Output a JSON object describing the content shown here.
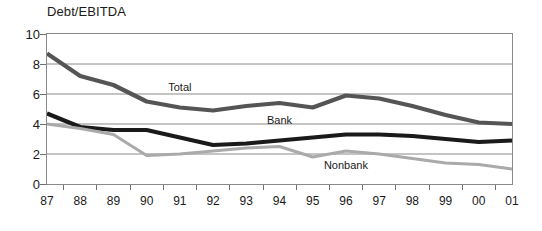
{
  "chart_data": {
    "type": "line",
    "title": "Debt/EBITDA",
    "xlabel": "",
    "ylabel": "",
    "ylim": [
      0,
      10
    ],
    "yticks": [
      0,
      2,
      4,
      6,
      8,
      10
    ],
    "grid": true,
    "legend_position": "inline-annotations",
    "categories": [
      "87",
      "88",
      "89",
      "90",
      "91",
      "92",
      "93",
      "94",
      "95",
      "96",
      "97",
      "98",
      "99",
      "00",
      "01"
    ],
    "series": [
      {
        "name": "Total",
        "color": "#555555",
        "width": 4.2,
        "label_x_category": "91",
        "label_value": 6.5,
        "values": [
          8.7,
          7.2,
          6.6,
          5.5,
          5.1,
          4.9,
          5.2,
          5.4,
          5.1,
          5.9,
          5.7,
          5.2,
          4.6,
          4.1,
          4.0
        ]
      },
      {
        "name": "Bank",
        "color": "#1a1a1a",
        "width": 4.2,
        "label_x_category": "94",
        "label_value": 4.3,
        "values": [
          4.7,
          3.8,
          3.6,
          3.6,
          3.1,
          2.6,
          2.7,
          2.9,
          3.1,
          3.3,
          3.3,
          3.2,
          3.0,
          2.8,
          2.9
        ]
      },
      {
        "name": "Nonbank",
        "color": "#aaaaaa",
        "width": 3.0,
        "label_x_category": "96",
        "label_value": 1.3,
        "values": [
          4.0,
          3.7,
          3.3,
          1.9,
          2.0,
          2.2,
          2.4,
          2.5,
          1.8,
          2.2,
          2.0,
          1.7,
          1.4,
          1.3,
          1.0
        ]
      }
    ]
  },
  "colors": {
    "background": "#ffffff",
    "axis": "#8a8a8a",
    "gridline": "#8a8a8a",
    "text": "#1a1a1a"
  }
}
